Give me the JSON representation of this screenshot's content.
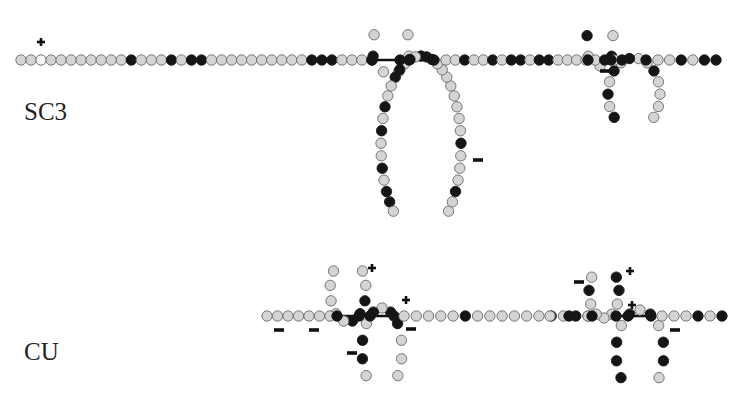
{
  "labels": {
    "sc3": "SC3",
    "cu": "CU"
  },
  "colors": {
    "light": "#d4d4d4",
    "dark": "#151515",
    "white": "#f4f4f4",
    "stroke": "#6a6a6a",
    "link": "#111111",
    "mark": "#111111"
  },
  "structures": [
    {
      "name": "SC3",
      "segments": [
        {
          "kind": "line",
          "from": [
            21,
            60
          ],
          "to": [
            372,
            60
          ],
          "pattern": "LLWLLLLLLLLDLLLDLDDLLLLLLLLLLDDDLLLD"
        },
        {
          "kind": "link",
          "from": [
            372,
            60
          ],
          "to": [
            434,
            60
          ],
          "nodes": [
            372,
            400,
            409,
            434
          ]
        },
        {
          "kind": "loop",
          "dir": "up",
          "cx": 391,
          "cy": 47,
          "rx": 19,
          "ry": 27,
          "pattern": "LLLLDL"
        },
        {
          "kind": "loop",
          "dir": "down",
          "cx": 421,
          "cy": 146,
          "rx": 40,
          "ry": 90,
          "pattern": "LLDLLLDLLLLLLLLDDDLDLDDLLDLDLLDLDDL"
        },
        {
          "kind": "line",
          "from": [
            446,
            60
          ],
          "to": [
            614,
            60
          ],
          "pattern": "LLDLLDLDDLDDLLLLLDL"
        },
        {
          "kind": "link",
          "from": [
            588,
            60
          ],
          "to": [
            646,
            60
          ],
          "nodes": [
            588,
            611,
            622,
            646
          ]
        },
        {
          "kind": "loop",
          "dir": "up",
          "cx": 600,
          "cy": 44,
          "rx": 14,
          "ry": 22,
          "pattern": "LDLLD"
        },
        {
          "kind": "loop",
          "dir": "down",
          "cx": 634,
          "cy": 94,
          "rx": 26,
          "ry": 36,
          "pattern": "LLLLDLLDLDLDLD"
        },
        {
          "kind": "line",
          "from": [
            658,
            60
          ],
          "to": [
            716,
            60
          ],
          "pattern": "LLDLDD"
        }
      ],
      "charges": [
        {
          "sign": "+",
          "x": 41,
          "y": 42
        },
        {
          "sign": "−",
          "x": 478,
          "y": 160
        },
        {
          "sign": "−",
          "x": 605,
          "y": 71
        }
      ]
    },
    {
      "name": "CU",
      "segments": [
        {
          "kind": "line",
          "from": [
            267,
            316
          ],
          "to": [
            330,
            316
          ],
          "pattern": "LLLLLLL"
        },
        {
          "kind": "link",
          "from": [
            337,
            316
          ],
          "to": [
            394,
            316
          ],
          "nodes": [
            337,
            359,
            370,
            394
          ]
        },
        {
          "kind": "loop",
          "dir": "up",
          "cx": 348,
          "cy": 290,
          "rx": 18,
          "ry": 32,
          "pattern": "LLDDDLLLLL"
        },
        {
          "kind": "loop",
          "dir": "down",
          "cx": 382,
          "cy": 350,
          "rx": 20,
          "ry": 42,
          "pattern": "LLLDDLDLDDL"
        },
        {
          "kind": "line",
          "from": [
            404,
            316
          ],
          "to": [
            588,
            316
          ],
          "pattern": "LLLLLDLLLLLLDLDL"
        },
        {
          "kind": "line",
          "from": [
            550,
            316
          ],
          "to": [
            588,
            316
          ],
          "pattern": "LDL"
        },
        {
          "kind": "link",
          "from": [
            592,
            316
          ],
          "to": [
            651,
            316
          ],
          "nodes": [
            592,
            616,
            628,
            651
          ]
        },
        {
          "kind": "loop",
          "dir": "up",
          "cx": 604,
          "cy": 292,
          "rx": 15,
          "ry": 26,
          "pattern": "DDLLLLLDL"
        },
        {
          "kind": "loop",
          "dir": "down",
          "cx": 640,
          "cy": 352,
          "rx": 24,
          "ry": 42,
          "pattern": "LDDLDLDLDDD"
        },
        {
          "kind": "line",
          "from": [
            662,
            316
          ],
          "to": [
            722,
            316
          ],
          "pattern": "LLLDLD"
        }
      ],
      "charges": [
        {
          "sign": "−",
          "x": 279,
          "y": 330
        },
        {
          "sign": "−",
          "x": 314,
          "y": 330
        },
        {
          "sign": "+",
          "x": 372,
          "y": 268
        },
        {
          "sign": "+",
          "x": 406,
          "y": 300
        },
        {
          "sign": "−",
          "x": 411,
          "y": 329
        },
        {
          "sign": "−",
          "x": 352,
          "y": 353
        },
        {
          "sign": "−",
          "x": 579,
          "y": 282
        },
        {
          "sign": "+",
          "x": 630,
          "y": 271
        },
        {
          "sign": "+",
          "x": 632,
          "y": 305
        },
        {
          "sign": "−",
          "x": 675,
          "y": 330
        }
      ]
    }
  ]
}
